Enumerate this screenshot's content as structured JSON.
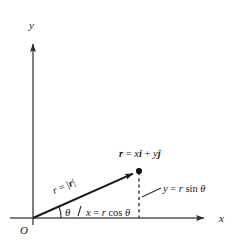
{
  "figure": {
    "kind": "vector-decomposition-diagram",
    "background_color": "#ffffff",
    "ink_color": "#1a1a1a",
    "axis_color": "#4a4a4a",
    "width": 238,
    "height": 250
  },
  "axes": {
    "x_label": "x",
    "y_label": "y",
    "origin_label": "O",
    "x_axis": {
      "x1": 10,
      "y1": 218,
      "x2": 212,
      "y2": 218
    },
    "y_axis": {
      "x1": 33,
      "y1": 225,
      "x2": 33,
      "y2": 36
    }
  },
  "vector": {
    "tail": {
      "x": 33,
      "y": 218
    },
    "head": {
      "x": 139,
      "y": 171
    },
    "label_parts": {
      "r_bold": "r",
      "equals": " = ",
      "x_italic": "x",
      "i_bold": "i",
      "plus": " + ",
      "y_italic": "y",
      "j_bold": "j"
    },
    "label_text": "r = xi + yj",
    "magnitude_label_parts": {
      "r_italic": "r",
      "equals": " = ",
      "bar_open": "|",
      "r_bold": "r",
      "bar_close": "|"
    },
    "magnitude_label_text": "r = |r|",
    "magnitude_label_rotation_deg": -24
  },
  "angle": {
    "symbol": "θ",
    "degrees_from_x_axis": 24,
    "arc_radius": 28
  },
  "components": {
    "x_component": {
      "label_parts": {
        "lhs": "x",
        "equals": " = ",
        "r": "r",
        "fn": "cos",
        "theta": "θ"
      },
      "label_text": "x = r cos θ"
    },
    "y_component": {
      "label_parts": {
        "lhs": "y",
        "equals": " = ",
        "r": "r",
        "fn": "sin",
        "theta": "θ"
      },
      "label_text": "y = r sin θ",
      "dashed_line": {
        "x": 139,
        "y_top": 172,
        "y_bottom": 218
      },
      "leader_line": {
        "x1": 143,
        "y1": 196,
        "x2": 161,
        "y2": 188
      }
    }
  }
}
